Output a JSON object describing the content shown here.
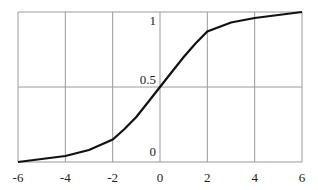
{
  "chart_data": {
    "type": "line",
    "title": "",
    "xlabel": "",
    "ylabel": "",
    "xlim": [
      -6,
      6
    ],
    "ylim": [
      0,
      1
    ],
    "grid": true,
    "legend": null,
    "x_ticks": [
      "-6",
      "-4",
      "-2",
      "0",
      "2",
      "4",
      "6"
    ],
    "y_ticks": [
      "0",
      "0.5",
      "1"
    ],
    "series": [
      {
        "name": "sigmoid",
        "x": [
          -6,
          -5,
          -4,
          -3,
          -2,
          -1.5,
          -1,
          -0.5,
          0,
          0.5,
          1,
          1.5,
          2,
          3,
          4,
          5,
          6
        ],
        "values": [
          0.0,
          0.02,
          0.04,
          0.08,
          0.15,
          0.22,
          0.3,
          0.4,
          0.5,
          0.6,
          0.7,
          0.79,
          0.87,
          0.93,
          0.96,
          0.98,
          1.0
        ]
      }
    ]
  },
  "colors": {
    "grid": "#9a9a9a",
    "line": "#111111",
    "text": "#222222"
  }
}
